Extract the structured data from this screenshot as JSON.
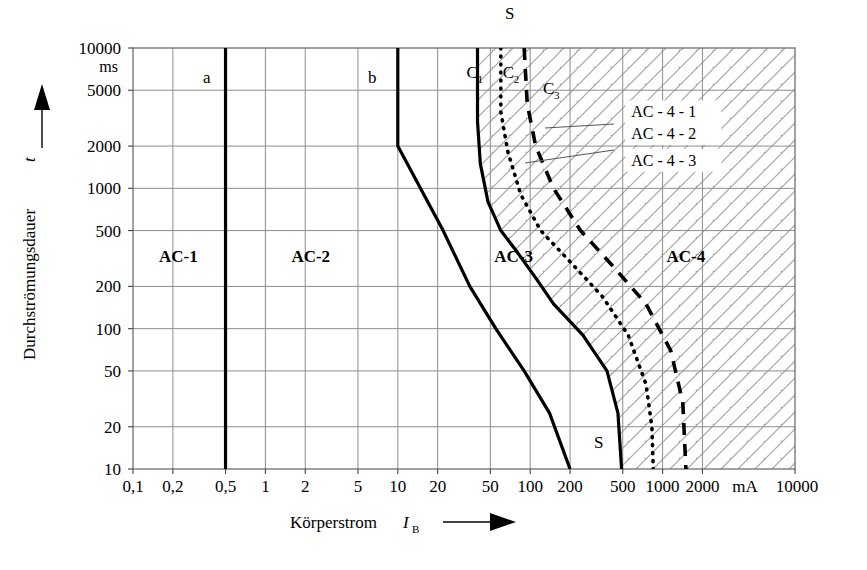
{
  "chart_data": {
    "type": "line",
    "title": "",
    "xlabel": "Körperstrom I_B",
    "ylabel": "Durchströmungsdauer t",
    "x_unit": "mA",
    "y_unit": "ms",
    "xscale": "log",
    "yscale": "log",
    "xlim": [
      0.1,
      10000
    ],
    "ylim": [
      10,
      10000
    ],
    "grid": true,
    "legend_position": "in-plot-annotations",
    "x_ticks": [
      "0,1",
      "0,2",
      "0,5",
      "1",
      "2",
      "5",
      "10",
      "20",
      "50",
      "100",
      "200",
      "500",
      "1000",
      "2000",
      "10000"
    ],
    "x_tick_values": [
      0.1,
      0.2,
      0.5,
      1,
      2,
      5,
      10,
      20,
      50,
      100,
      200,
      500,
      1000,
      2000,
      10000
    ],
    "y_ticks": [
      "10",
      "20",
      "50",
      "100",
      "200",
      "500",
      "1000",
      "2000",
      "5000",
      "10000"
    ],
    "y_tick_values": [
      10,
      20,
      50,
      100,
      200,
      500,
      1000,
      2000,
      5000,
      10000
    ],
    "zones": [
      {
        "name": "AC-1",
        "label": "AC-1",
        "x": 0.22,
        "y": 300
      },
      {
        "name": "AC-2",
        "label": "AC-2",
        "x": 2.2,
        "y": 300
      },
      {
        "name": "AC-3",
        "label": "AC-3",
        "x": 75,
        "y": 300
      },
      {
        "name": "AC-4",
        "label": "AC-4",
        "x": 1500,
        "y": 300
      }
    ],
    "annotations": [
      {
        "name": "curve-a-label",
        "label": "a",
        "x": 0.36,
        "y": 5600
      },
      {
        "name": "curve-b-label",
        "label": "b",
        "x": 6.4,
        "y": 5600
      },
      {
        "name": "curve-s-top-label",
        "label": "S",
        "x": 70,
        "y": 16000
      },
      {
        "name": "curve-s-bottom-label",
        "label": "S",
        "x": 330,
        "y": 14
      },
      {
        "name": "ac-4-1-label",
        "label": "AC - 4 - 1",
        "x": 580,
        "y": 3200
      },
      {
        "name": "ac-4-2-label",
        "label": "AC - 4 - 2",
        "x": 580,
        "y": 2250
      },
      {
        "name": "ac-4-3-label",
        "label": "AC - 4 - 3",
        "x": 580,
        "y": 1450
      }
    ],
    "curve_labels": [
      {
        "name": "curve-c1-label",
        "base": "C",
        "sub": "1",
        "x": 33,
        "y": 6100
      },
      {
        "name": "curve-c2-label",
        "base": "C",
        "sub": "2",
        "x": 62,
        "y": 6100
      },
      {
        "name": "curve-c3-label",
        "base": "C",
        "sub": "3",
        "x": 125,
        "y": 4700
      }
    ],
    "series": [
      {
        "name": "a",
        "description": "Threshold of perception (curve a) — boundary AC-1 / AC-2",
        "style": "solid",
        "width": 3.2,
        "points": [
          [
            0.5,
            10
          ],
          [
            0.5,
            10000
          ]
        ]
      },
      {
        "name": "b",
        "description": "Threshold of let-go (curve b) — boundary AC-2 / AC-3",
        "style": "solid",
        "width": 3.2,
        "points": [
          [
            10,
            10000
          ],
          [
            10,
            2000
          ],
          [
            22,
            500
          ],
          [
            35,
            200
          ],
          [
            55,
            100
          ],
          [
            90,
            50
          ],
          [
            140,
            25
          ],
          [
            200,
            10
          ]
        ]
      },
      {
        "name": "C1",
        "description": "Threshold of ventricular fibrillation (curve c1) — boundary AC-3 / AC-4",
        "style": "solid",
        "width": 3.2,
        "points": [
          [
            40,
            10000
          ],
          [
            40,
            3000
          ],
          [
            42,
            1500
          ],
          [
            48,
            800
          ],
          [
            60,
            500
          ],
          [
            80,
            350
          ],
          [
            110,
            230
          ],
          [
            150,
            150
          ],
          [
            250,
            90
          ],
          [
            380,
            50
          ],
          [
            460,
            25
          ],
          [
            490,
            10
          ]
        ]
      },
      {
        "name": "C2",
        "description": "5 % probability of ventricular fibrillation (curve c2) — boundary AC-4-1 / AC-4-2",
        "style": "dotted",
        "width": 3.6,
        "points": [
          [
            60,
            10000
          ],
          [
            60,
            3500
          ],
          [
            68,
            1800
          ],
          [
            85,
            900
          ],
          [
            120,
            500
          ],
          [
            200,
            300
          ],
          [
            350,
            170
          ],
          [
            550,
            90
          ],
          [
            750,
            40
          ],
          [
            830,
            20
          ],
          [
            850,
            10
          ]
        ]
      },
      {
        "name": "C3",
        "description": "50 % probability of ventricular fibrillation (curve c3) — boundary AC-4-2 / AC-4-3",
        "style": "dashed",
        "width": 3.6,
        "points": [
          [
            90,
            10000
          ],
          [
            95,
            4000
          ],
          [
            110,
            2000
          ],
          [
            150,
            1000
          ],
          [
            240,
            500
          ],
          [
            420,
            280
          ],
          [
            750,
            150
          ],
          [
            1150,
            70
          ],
          [
            1420,
            30
          ],
          [
            1500,
            10
          ]
        ]
      }
    ],
    "hatching": {
      "description": "45 degree hatching fills the AC-4 zones right of curve C1",
      "angle_deg": 45,
      "color": "#888888"
    },
    "colors": {
      "curve": "#000000",
      "grid": "#8d8d8d",
      "frame": "#6f6f6f",
      "hatch": "#9a9a9a",
      "text": "#000000",
      "background": "#ffffff"
    }
  }
}
